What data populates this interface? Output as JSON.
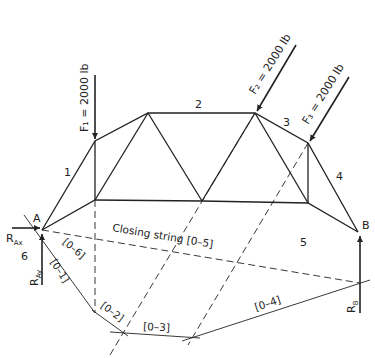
{
  "diagram": {
    "type": "truss funicular polygon",
    "nodes": {
      "A": "A",
      "B": "B"
    },
    "forces": {
      "F1": "F₁ = 2000 lb",
      "F2": "F₂ = 2000 lb",
      "F3": "F₃ = 2000 lb"
    },
    "reactions": {
      "RAx_main": "R",
      "RAx_sub": "Ax",
      "RAy_main": "R",
      "RAy_sub": "Ay",
      "RB_main": "R",
      "RB_sub": "B"
    },
    "spaces": [
      "1",
      "2",
      "3",
      "4",
      "5",
      "6"
    ],
    "strings": {
      "closing": "Closing string [0–5]",
      "s01": "[0–1]",
      "s02": "[0–2]",
      "s03": "[0–3]",
      "s04": "[0–4]",
      "s06": "[0–6]"
    },
    "colors": {
      "line": "#222222",
      "background": "#ffffff"
    }
  }
}
